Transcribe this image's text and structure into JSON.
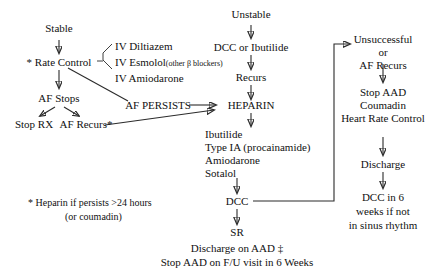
{
  "diagram": {
    "branches": {
      "stable": {
        "root": "Stable",
        "rate_control": "* Rate Control",
        "drugs": [
          "IV Diltiazem",
          "IV Esmolol",
          "IV Amiodarone"
        ],
        "esmolol_note": "(other β blockers)",
        "af_stops": "AF Stops",
        "stop_rx": "Stop RX",
        "af_recurs": "AF Recurs*",
        "af_persists": "AF PERSISTS"
      },
      "unstable": {
        "root": "Unstable",
        "dcc_or_ibutilide": "DCC or  Ibutilide",
        "recurs": "Recurs"
      },
      "central": {
        "heparin": "HEPARIN",
        "antiarrhythmics": [
          "Ibutilide",
          "Type IA (procainamide)",
          "Amiodarone",
          "Sotalol"
        ],
        "dcc": "DCC",
        "sr": "SR",
        "discharge_aad": "Discharge on  AAD ‡",
        "stop_aad": "Stop AAD on F/U visit in  6 Weeks"
      },
      "right": {
        "unsuccessful": "Unsuccessful",
        "or": "or",
        "af_recurs": "AF Recurs",
        "stop_aad": "Stop AAD",
        "coumadin": "Coumadin",
        "heart_rate_control": "Heart Rate Control",
        "discharge": "Discharge",
        "dcc_6weeks_line1": "DCC  in 6",
        "dcc_6weeks_line2": "weeks if not",
        "dcc_6weeks_line3": "in sinus rhythm"
      }
    },
    "footnote": {
      "line1": "*  Heparin if persists >24 hours",
      "line2": "(or coumadin)"
    },
    "colors": {
      "background": "#ffffff",
      "text": "#111111",
      "stroke": "#2b2b2b"
    }
  }
}
